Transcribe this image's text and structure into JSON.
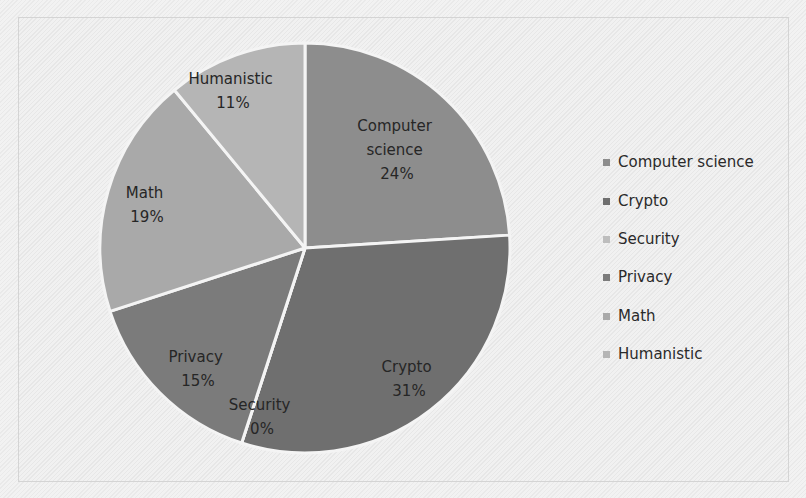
{
  "chart_data": {
    "type": "pie",
    "title": "",
    "categories": [
      "Computer science",
      "Crypto",
      "Security",
      "Privacy",
      "Math",
      "Humanistic"
    ],
    "values": [
      24,
      31,
      0,
      15,
      19,
      11
    ],
    "value_labels": [
      "24%",
      "31%",
      "0%",
      "15%",
      "19%",
      "11%"
    ],
    "legend_position": "right",
    "start_angle": "12 o'clock, clockwise"
  },
  "slices": [
    {
      "name": "Computer science",
      "label_lines": [
        "Computer",
        "science",
        "24%"
      ],
      "color": "#8d8d8d",
      "value": 24
    },
    {
      "name": "Crypto",
      "label_lines": [
        "Crypto",
        "31%"
      ],
      "color": "#6f6f6f",
      "value": 31
    },
    {
      "name": "Security",
      "label_lines": [
        "Security",
        "0%"
      ],
      "color": "#bdbdbd",
      "value": 0
    },
    {
      "name": "Privacy",
      "label_lines": [
        "Privacy",
        "15%"
      ],
      "color": "#7b7b7b",
      "value": 15
    },
    {
      "name": "Math",
      "label_lines": [
        "Math",
        "19%"
      ],
      "color": "#a9a9a9",
      "value": 19
    },
    {
      "name": "Humanistic",
      "label_lines": [
        "Humanistic",
        "11%"
      ],
      "color": "#b5b5b5",
      "value": 11
    }
  ],
  "legend": {
    "items": [
      {
        "label": "Computer science",
        "color": "#8d8d8d"
      },
      {
        "label": "Crypto",
        "color": "#6f6f6f"
      },
      {
        "label": "Security",
        "color": "#bdbdbd"
      },
      {
        "label": "Privacy",
        "color": "#7b7b7b"
      },
      {
        "label": "Math",
        "color": "#a9a9a9"
      },
      {
        "label": "Humanistic",
        "color": "#b5b5b5"
      }
    ]
  }
}
